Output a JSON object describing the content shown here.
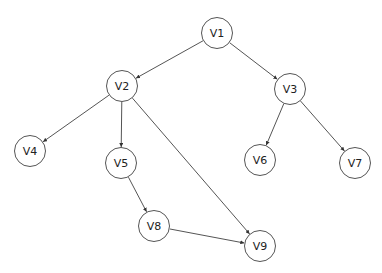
{
  "diagram": {
    "type": "directed-graph",
    "node_radius": 16,
    "stroke_color": "#555555",
    "nodes": [
      {
        "id": "V1",
        "label": "V1",
        "x": 217,
        "y": 33
      },
      {
        "id": "V2",
        "label": "V2",
        "x": 122,
        "y": 86
      },
      {
        "id": "V3",
        "label": "V3",
        "x": 290,
        "y": 89
      },
      {
        "id": "V4",
        "label": "V4",
        "x": 30,
        "y": 151
      },
      {
        "id": "V5",
        "label": "V5",
        "x": 121,
        "y": 163
      },
      {
        "id": "V6",
        "label": "V6",
        "x": 260,
        "y": 160
      },
      {
        "id": "V7",
        "label": "V7",
        "x": 355,
        "y": 163
      },
      {
        "id": "V8",
        "label": "V8",
        "x": 154,
        "y": 226
      },
      {
        "id": "V9",
        "label": "V9",
        "x": 260,
        "y": 246
      }
    ],
    "edges": [
      {
        "from": "V1",
        "to": "V2"
      },
      {
        "from": "V1",
        "to": "V3"
      },
      {
        "from": "V2",
        "to": "V4"
      },
      {
        "from": "V2",
        "to": "V5"
      },
      {
        "from": "V2",
        "to": "V9"
      },
      {
        "from": "V3",
        "to": "V6"
      },
      {
        "from": "V3",
        "to": "V7"
      },
      {
        "from": "V5",
        "to": "V8"
      },
      {
        "from": "V8",
        "to": "V9"
      }
    ]
  }
}
